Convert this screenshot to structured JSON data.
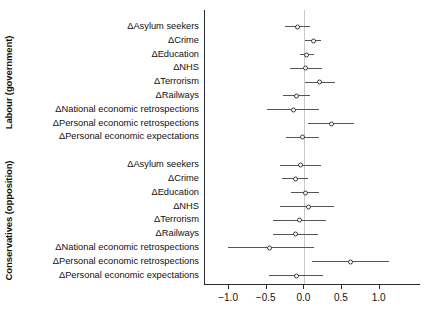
{
  "chart_data": {
    "type": "scatter",
    "title": "",
    "xlabel": "",
    "ylabel": "",
    "xlim": [
      -1.32,
      1.55
    ],
    "xticks": [
      -1.0,
      -0.5,
      0.0,
      0.5,
      1.0
    ],
    "xticklabels": [
      "−1.0",
      "−0.5",
      "0.0",
      "0.5",
      "1.0"
    ],
    "grid": false,
    "legend": "none",
    "reference_line": 0.0,
    "marker": "open-circle",
    "error_bars": "horizontal 95% confidence intervals",
    "groups": [
      {
        "name": "Labour (government)",
        "rows": [
          {
            "label": "ΔAsylum seekers",
            "estimate": -0.09,
            "low": -0.26,
            "high": 0.08
          },
          {
            "label": "ΔCrime",
            "estimate": 0.12,
            "low": 0.01,
            "high": 0.22
          },
          {
            "label": "ΔEducation",
            "estimate": 0.03,
            "low": -0.06,
            "high": 0.13
          },
          {
            "label": "ΔNHS",
            "estimate": 0.02,
            "low": -0.19,
            "high": 0.23
          },
          {
            "label": "ΔTerrorism",
            "estimate": 0.2,
            "low": 0.01,
            "high": 0.41
          },
          {
            "label": "ΔRailways",
            "estimate": -0.1,
            "low": -0.28,
            "high": 0.07
          },
          {
            "label": "ΔNational economic retrospections",
            "estimate": -0.15,
            "low": -0.49,
            "high": 0.2
          },
          {
            "label": "ΔPersonal economic retrospections",
            "estimate": 0.36,
            "low": 0.05,
            "high": 0.66
          },
          {
            "label": "ΔPersonal economic expectations",
            "estimate": -0.02,
            "low": -0.24,
            "high": 0.19
          }
        ]
      },
      {
        "name": "Conservatives (opposition)",
        "rows": [
          {
            "label": "ΔAsylum seekers",
            "estimate": -0.05,
            "low": -0.32,
            "high": 0.22
          },
          {
            "label": "ΔCrime",
            "estimate": -0.12,
            "low": -0.3,
            "high": 0.05
          },
          {
            "label": "ΔEducation",
            "estimate": 0.01,
            "low": -0.18,
            "high": 0.19
          },
          {
            "label": "ΔNHS",
            "estimate": 0.05,
            "low": -0.32,
            "high": 0.4
          },
          {
            "label": "ΔTerrorism",
            "estimate": -0.06,
            "low": -0.41,
            "high": 0.29
          },
          {
            "label": "ΔRailways",
            "estimate": -0.12,
            "low": -0.41,
            "high": 0.18
          },
          {
            "label": "ΔNational economic retrospections",
            "estimate": -0.46,
            "low": -1.02,
            "high": 0.13
          },
          {
            "label": "ΔPersonal economic retrospections",
            "estimate": 0.61,
            "low": 0.1,
            "high": 1.13
          },
          {
            "label": "ΔPersonal economic expectations",
            "estimate": -0.11,
            "low": -0.47,
            "high": 0.25
          }
        ]
      }
    ]
  }
}
